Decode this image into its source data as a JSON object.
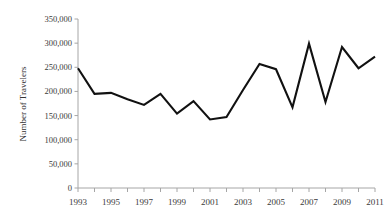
{
  "chart_data": {
    "type": "line",
    "title": "",
    "subtitle": "",
    "xlabel": "",
    "ylabel": "Number of Travelers",
    "x": [
      1993,
      1994,
      1995,
      1996,
      1997,
      1998,
      1999,
      2000,
      2001,
      2002,
      2003,
      2004,
      2005,
      2006,
      2007,
      2008,
      2009,
      2010,
      2011
    ],
    "values": [
      248000,
      195000,
      197000,
      184000,
      172000,
      195000,
      154000,
      180000,
      142000,
      147000,
      203000,
      257000,
      246000,
      167000,
      299000,
      178000,
      292000,
      248000,
      272000
    ],
    "series": [
      {
        "name": "Number of Travelers",
        "values": [
          248000,
          195000,
          197000,
          184000,
          172000,
          195000,
          154000,
          180000,
          142000,
          147000,
          203000,
          257000,
          246000,
          167000,
          299000,
          178000,
          292000,
          248000,
          272000
        ]
      }
    ],
    "xlim": [
      1993,
      2011
    ],
    "ylim": [
      0,
      350000
    ],
    "y_tick_values": [
      0,
      50000,
      100000,
      150000,
      200000,
      250000,
      300000,
      350000
    ],
    "y_tick_labels": [
      "0",
      "50,000",
      "100,000",
      "150,000",
      "200,000",
      "250,000",
      "300,000",
      "350,000"
    ],
    "x_tick_values": [
      1993,
      1994,
      1995,
      1996,
      1997,
      1998,
      1999,
      2000,
      2001,
      2002,
      2003,
      2004,
      2005,
      2006,
      2007,
      2008,
      2009,
      2010,
      2011
    ],
    "x_tick_labels": [
      "1993",
      "",
      "1995",
      "",
      "1997",
      "",
      "1999",
      "",
      "2001",
      "",
      "2003",
      "",
      "2005",
      "",
      "2007",
      "",
      "2009",
      "",
      "2011"
    ],
    "x_labeled_values": [
      1993,
      1995,
      1997,
      1999,
      2001,
      2003,
      2005,
      2007,
      2009,
      2011
    ],
    "x_labeled_text": [
      "1993",
      "1995",
      "1997",
      "1999",
      "2001",
      "2003",
      "2005",
      "2007",
      "2009",
      "2011"
    ],
    "grid": false,
    "legend": false,
    "legend_position": "none",
    "line_color": "#111111",
    "axis_color": "#a6a6a6",
    "text_color": "#3a3a3a",
    "markers": false
  }
}
